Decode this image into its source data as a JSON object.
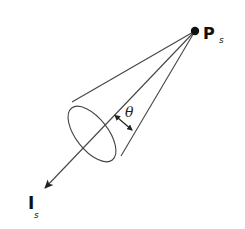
{
  "diagram": {
    "type": "spotlight-cone",
    "apex_label": {
      "main": "P",
      "sub": "s"
    },
    "axis_label": {
      "main": "I",
      "sub": "s"
    },
    "angle_label": "θ",
    "colors": {
      "stroke": "#333333",
      "fill": "#111111",
      "background": "#ffffff"
    }
  }
}
